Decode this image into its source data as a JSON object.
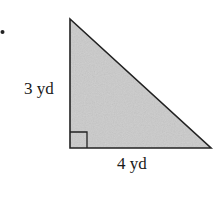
{
  "figure": {
    "type": "right-triangle",
    "bullet": "•",
    "fill_color": "#cbcbcb",
    "stroke_color": "#222222",
    "vertices": {
      "top": [
        70,
        19
      ],
      "right_angle": [
        70,
        148
      ],
      "right": [
        211,
        148
      ]
    },
    "right_angle_marker_size": 17,
    "labels": {
      "vertical_side": "3 yd",
      "horizontal_side": "4 yd"
    }
  }
}
